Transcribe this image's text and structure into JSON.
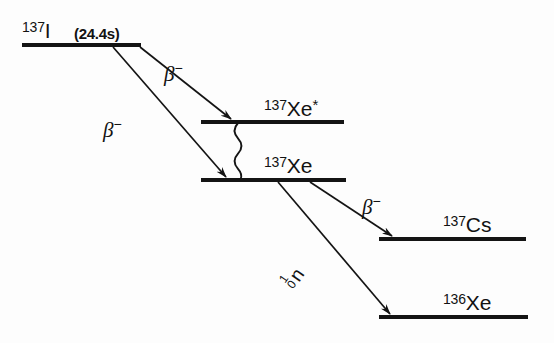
{
  "diagram": {
    "levels": [
      {
        "id": "i137",
        "mass": "137",
        "symbol": "I",
        "excited_marker": "",
        "annotation": "(24.4s)",
        "line": {
          "x1": 22,
          "x2": 141,
          "y": 45
        },
        "label_pos": {
          "x": 22,
          "y": 20
        },
        "annotation_pos": {
          "x": 73,
          "y": 24
        }
      },
      {
        "id": "xe137m",
        "mass": "137",
        "symbol": "Xe",
        "excited_marker": "*",
        "annotation": "",
        "line": {
          "x1": 201,
          "x2": 344,
          "y": 122
        },
        "label_pos": {
          "x": 264,
          "y": 97
        }
      },
      {
        "id": "xe137",
        "mass": "137",
        "symbol": "Xe",
        "excited_marker": "",
        "annotation": "",
        "line": {
          "x1": 201,
          "x2": 346,
          "y": 180
        },
        "label_pos": {
          "x": 264,
          "y": 155
        }
      },
      {
        "id": "cs137",
        "mass": "137",
        "symbol": "Cs",
        "excited_marker": "",
        "annotation": "",
        "line": {
          "x1": 379,
          "x2": 526,
          "y": 239
        },
        "label_pos": {
          "x": 443,
          "y": 214
        }
      },
      {
        "id": "xe136",
        "mass": "136",
        "symbol": "Xe",
        "excited_marker": "",
        "annotation": "",
        "line": {
          "x1": 379,
          "x2": 528,
          "y": 317
        },
        "label_pos": {
          "x": 443,
          "y": 292
        }
      }
    ],
    "transitions": [
      {
        "id": "beta-to-xe137m",
        "kind": "beta-minus",
        "from": "i137",
        "to": "xe137m",
        "label": "β",
        "charge": "−",
        "path": {
          "x1": 140,
          "y1": 47,
          "x2": 233,
          "y2": 120
        },
        "label_pos": {
          "x": 164,
          "y": 60
        }
      },
      {
        "id": "beta-to-xe137",
        "kind": "beta-minus",
        "from": "i137",
        "to": "xe137",
        "label": "β",
        "charge": "−",
        "path": {
          "x1": 113,
          "y1": 47,
          "x2": 228,
          "y2": 178
        },
        "label_pos": {
          "x": 103,
          "y": 116
        }
      },
      {
        "id": "gamma-xe137m-to-xe137",
        "kind": "gamma",
        "from": "xe137m",
        "to": "xe137",
        "label": "",
        "charge": "",
        "path": {
          "x": 238,
          "y1": 123,
          "y2": 179,
          "amplitude": 4.6,
          "cycles": 5.5
        }
      },
      {
        "id": "beta-to-cs137",
        "kind": "beta-minus",
        "from": "xe137",
        "to": "cs137",
        "label": "β",
        "charge": "−",
        "path": {
          "x1": 310,
          "y1": 182,
          "x2": 394,
          "y2": 237
        },
        "label_pos": {
          "x": 362,
          "y": 193
        }
      },
      {
        "id": "neutron-to-xe136",
        "kind": "neutron-emission",
        "from": "xe137",
        "to": "xe136",
        "label": "n",
        "mass_number": "1",
        "charge_number": "0",
        "path": {
          "x1": 278,
          "y1": 182,
          "x2": 392,
          "y2": 315
        },
        "label_pos": {
          "x": 298,
          "y": 285
        },
        "label_rotation_deg": -55
      }
    ],
    "colors": {
      "ink": "#141414",
      "background": "#fdfdfd"
    }
  }
}
